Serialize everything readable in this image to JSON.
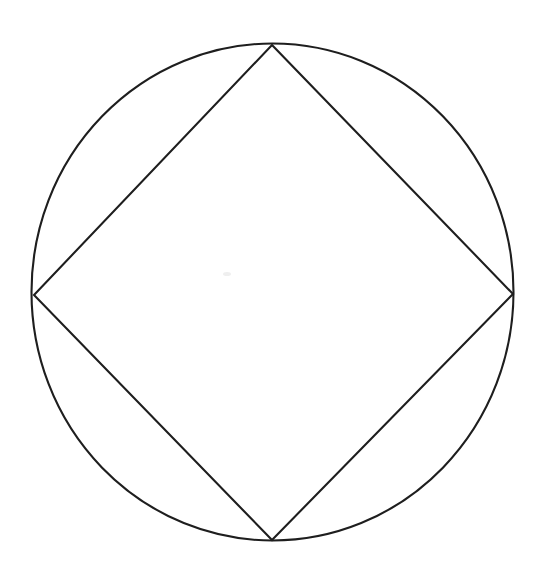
{
  "figure": {
    "background_color": "#ffffff",
    "stroke_color": "#1e1e1e",
    "stroke_width": 2.1,
    "canvas": {
      "width": 535,
      "height": 568
    }
  },
  "chart_data": {
    "type": "diagram",
    "xlabel": "",
    "ylabel": "",
    "grid": false,
    "legend": false,
    "xlim": [
      0,
      535
    ],
    "ylim": [
      0,
      568
    ],
    "shapes": [
      {
        "name": "circumscribed-circle",
        "kind": "ellipse",
        "cx": 272.5,
        "cy": 292.0,
        "rx": 241.0,
        "ry": 248.5,
        "stroke": "#1e1e1e",
        "fill": "none"
      },
      {
        "name": "inscribed-square",
        "kind": "polygon",
        "points": [
          {
            "label": "top-vertex",
            "x": 272,
            "y": 45
          },
          {
            "label": "right-vertex",
            "x": 513,
            "y": 294
          },
          {
            "label": "bottom-vertex",
            "x": 272,
            "y": 540
          },
          {
            "label": "left-vertex",
            "x": 34,
            "y": 295
          }
        ],
        "stroke": "#1e1e1e",
        "fill": "none"
      }
    ],
    "edges": [
      {
        "name": "edge-top-right",
        "from": "top-vertex",
        "to": "right-vertex"
      },
      {
        "name": "edge-right-bottom",
        "from": "right-vertex",
        "to": "bottom-vertex"
      },
      {
        "name": "edge-bottom-left",
        "from": "bottom-vertex",
        "to": "left-vertex"
      },
      {
        "name": "edge-left-top",
        "from": "left-vertex",
        "to": "top-vertex"
      }
    ],
    "annotations": [],
    "labels": []
  }
}
